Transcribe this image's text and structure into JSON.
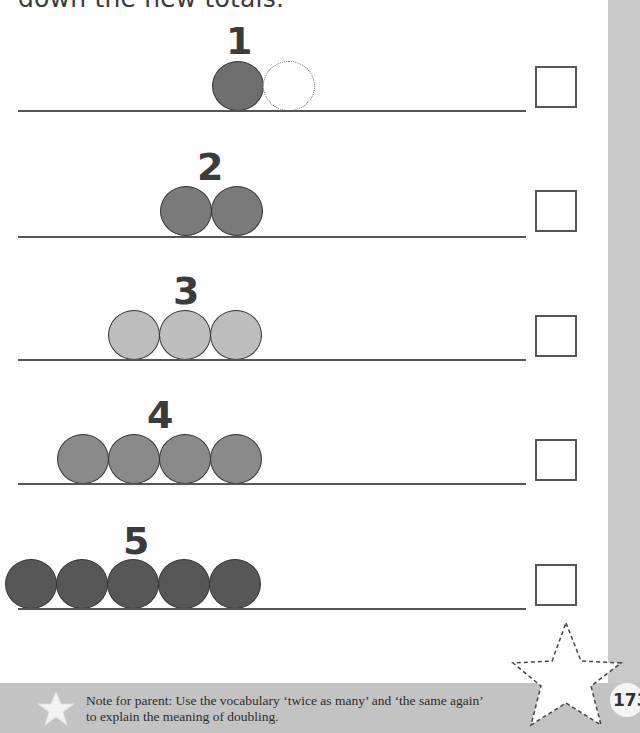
{
  "instruction": "down the new totals.",
  "rows": [
    {
      "number": "1",
      "counters": 1,
      "doubled_placeholder": 1,
      "color": "#6e6e6e",
      "answer": ""
    },
    {
      "number": "2",
      "counters": 2,
      "doubled_placeholder": 0,
      "color": "#7a7a7a",
      "answer": ""
    },
    {
      "number": "3",
      "counters": 3,
      "doubled_placeholder": 0,
      "color": "#bdbdbd",
      "answer": ""
    },
    {
      "number": "4",
      "counters": 4,
      "doubled_placeholder": 0,
      "color": "#8a8a8a",
      "answer": ""
    },
    {
      "number": "5",
      "counters": 5,
      "doubled_placeholder": 0,
      "color": "#575757",
      "answer": ""
    }
  ],
  "footer": {
    "note": "Note for parent:  Use the vocabulary ‘twice as many’ and ‘the same again’ to explain the meaning of doubling.",
    "page_number": "173",
    "icon": "star-icon"
  },
  "colors": {
    "side_strip": "#c9c9c9",
    "footer_band": "#c3c3c3"
  }
}
